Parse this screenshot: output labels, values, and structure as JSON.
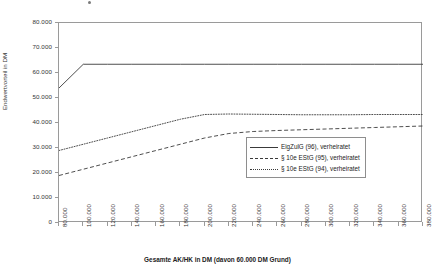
{
  "chart_data": {
    "type": "line",
    "title": "",
    "xlabel": "Gesamte AK/HK in DM (davon 60.000 DM Grund)",
    "ylabel": "Endwertvorteil in DM",
    "xlim": [
      80000,
      380000
    ],
    "ylim": [
      0,
      80000
    ],
    "grid": false,
    "legend_position": "inside-right",
    "xticks": [
      "80.000",
      "100.000",
      "120.000",
      "140.000",
      "160.000",
      "180.000",
      "200.000",
      "220.000",
      "240.000",
      "260.000",
      "280.000",
      "300.000",
      "320.000",
      "340.000",
      "360.000",
      "380.000"
    ],
    "yticks": [
      "0",
      "10.000",
      "20.000",
      "30.000",
      "40.000",
      "50.000",
      "60.000",
      "70.000",
      "80.000"
    ],
    "x": [
      80000,
      100000,
      120000,
      140000,
      160000,
      180000,
      200000,
      220000,
      240000,
      260000,
      280000,
      300000,
      320000,
      340000,
      360000,
      380000
    ],
    "series": [
      {
        "name": "EigZulG (96), verheiratet",
        "style": "solid",
        "values": [
          54000,
          63500,
          63500,
          63500,
          63500,
          63500,
          63500,
          63500,
          63500,
          63500,
          63500,
          63500,
          63500,
          63500,
          63500,
          63500
        ]
      },
      {
        "name": "§ 10e EStG (95), verheiratet",
        "style": "dashed",
        "values": [
          19000,
          21500,
          24000,
          26500,
          29000,
          31500,
          34000,
          35800,
          36600,
          37000,
          37300,
          37600,
          37900,
          38200,
          38500,
          38800
        ]
      },
      {
        "name": "§ 10e EStG (94), verheiratet",
        "style": "dotted",
        "values": [
          29000,
          31500,
          34000,
          36500,
          39000,
          41500,
          43400,
          43600,
          43500,
          43400,
          43300,
          43300,
          43300,
          43400,
          43400,
          43400
        ]
      }
    ]
  },
  "legend": {
    "items": [
      {
        "label": "EigZulG (96), verheiratet",
        "style": "solid"
      },
      {
        "label": "§ 10e EStG (95), verheiratet",
        "style": "dashed"
      },
      {
        "label": "§ 10e EStG (94), verheiratet",
        "style": "dotted"
      }
    ]
  }
}
